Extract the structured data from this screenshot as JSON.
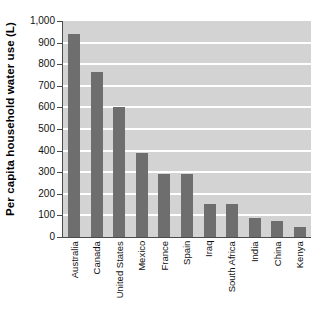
{
  "chart_data": {
    "type": "bar",
    "title": "",
    "xlabel": "",
    "ylabel": "Per capita household water use (L)",
    "categories": [
      "Australia",
      "Canada",
      "United States",
      "Mexico",
      "France",
      "Spain",
      "Iraq",
      "South Africa",
      "India",
      "China",
      "Kenya"
    ],
    "values": [
      940,
      765,
      600,
      388,
      290,
      290,
      152,
      154,
      88,
      75,
      47
    ],
    "ylim": [
      0,
      1000
    ],
    "ytick_values": [
      0,
      100,
      200,
      300,
      400,
      500,
      600,
      700,
      800,
      900,
      1000
    ],
    "ytick_labels": [
      "0",
      "100",
      "200",
      "300",
      "400",
      "500",
      "600",
      "700",
      "800",
      "900",
      "1,000"
    ],
    "grid": true,
    "grid_color": "#ffffff",
    "legend": false,
    "plot_background": "#d3d3d3",
    "bar_color": "#6e6e6e",
    "axis_color": "#4a4a4a"
  }
}
